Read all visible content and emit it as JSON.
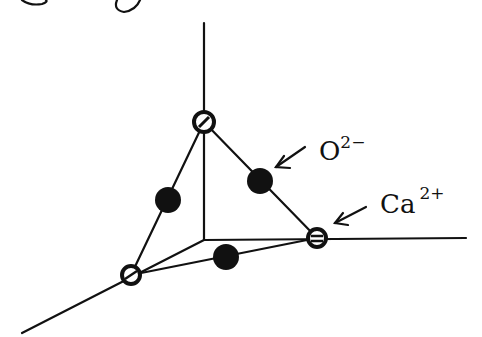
{
  "diagram": {
    "title": "",
    "colors": {
      "ink": "#111111",
      "background": "#ffffff"
    },
    "labels": {
      "oxide": {
        "base": "O",
        "charge": "2−"
      },
      "calcium": {
        "base": "Ca",
        "charge": "2+"
      }
    },
    "nodes": [
      {
        "id": "ca-top",
        "species": "Ca2+",
        "x": 204,
        "y": 122
      },
      {
        "id": "ca-right",
        "species": "Ca2+",
        "x": 317,
        "y": 238
      },
      {
        "id": "ca-left",
        "species": "Ca2+",
        "x": 131,
        "y": 275
      },
      {
        "id": "o-left-edge",
        "species": "O2-",
        "x": 168,
        "y": 200
      },
      {
        "id": "o-right-edge",
        "species": "O2-",
        "x": 260,
        "y": 181
      },
      {
        "id": "o-bottom-edge",
        "species": "O2-",
        "x": 226,
        "y": 257
      }
    ],
    "axes": {
      "origin": {
        "x": 204,
        "y": 240
      },
      "vertical_end": {
        "x": 204,
        "y": 23
      },
      "horizontal_end": {
        "x": 466,
        "y": 238
      },
      "diagonal_end": {
        "x": 22,
        "y": 333
      }
    }
  }
}
